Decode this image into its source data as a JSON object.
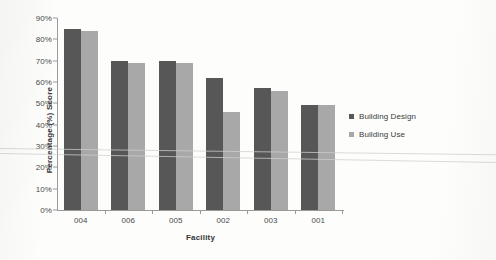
{
  "chart_data": {
    "type": "bar",
    "title": "",
    "xlabel": "Facility",
    "ylabel": "Percentage (%) Score",
    "categories": [
      "004",
      "006",
      "005",
      "002",
      "003",
      "001"
    ],
    "series": [
      {
        "name": "Building Design",
        "color": "#575757",
        "values": [
          85,
          70,
          70,
          62,
          57,
          49
        ]
      },
      {
        "name": "Building Use",
        "color": "#a8a8a8",
        "values": [
          84,
          69,
          69,
          46,
          56,
          49
        ]
      }
    ],
    "ylim": [
      0,
      90
    ],
    "ytick_labels": [
      "90%",
      "80%",
      "70%",
      "60%",
      "50%",
      "40%",
      "30%",
      "20%",
      "10%",
      "0%"
    ],
    "ytick_values": [
      90,
      80,
      70,
      60,
      50,
      40,
      30,
      20,
      10,
      0
    ],
    "grid": false,
    "legend_position": "right"
  },
  "legend": {
    "entries": [
      {
        "label": "Building Design"
      },
      {
        "label": "Building Use"
      }
    ]
  }
}
